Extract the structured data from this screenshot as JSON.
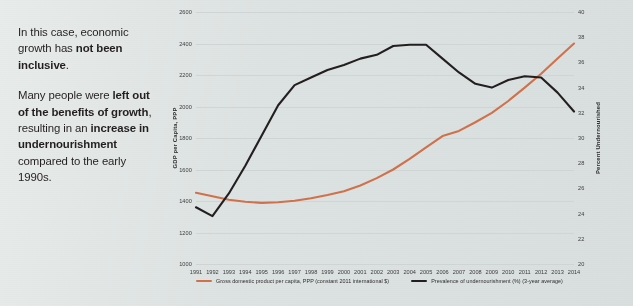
{
  "narrative": {
    "paragraph1": [
      {
        "text": "In this case, economic growth has ",
        "bold": false
      },
      {
        "text": "not been inclusive",
        "bold": true
      },
      {
        "text": ".",
        "bold": false
      }
    ],
    "paragraph2": [
      {
        "text": "Many people were ",
        "bold": false
      },
      {
        "text": "left out of the benefits of growth",
        "bold": true
      },
      {
        "text": ", resulting in an ",
        "bold": false
      },
      {
        "text": "increase in undernourishment",
        "bold": true
      },
      {
        "text": " compared to the early 1990s.",
        "bold": false
      }
    ]
  },
  "chart_data": {
    "type": "line",
    "title": "",
    "xlabel": "",
    "ylabel": "GDP per Capita, PPP",
    "y2label": "Percent Undernourished",
    "grid": true,
    "legend_position": "bottom",
    "categories": [
      1991,
      1992,
      1993,
      1994,
      1995,
      1996,
      1997,
      1998,
      1999,
      2000,
      2001,
      2002,
      2003,
      2004,
      2005,
      2006,
      2007,
      2008,
      2009,
      2010,
      2011,
      2012,
      2013,
      2014
    ],
    "xtick_labels": [
      "1991",
      "1992",
      "1993",
      "1994",
      "1995",
      "1996",
      "1997",
      "1998",
      "1999",
      "2000",
      "2001",
      "2002",
      "2003",
      "2004",
      "2005",
      "2006",
      "2007",
      "2008",
      "2009",
      "2010",
      "2011",
      "2012",
      "2013",
      "2014"
    ],
    "ylim": [
      1000,
      2600
    ],
    "ytick_labels": [
      "1000",
      "1200",
      "1400",
      "1600",
      "1800",
      "2000",
      "2200",
      "2400",
      "2600"
    ],
    "ytick_values": [
      1000,
      1200,
      1400,
      1600,
      1800,
      2000,
      2200,
      2400,
      2600
    ],
    "y2lim": [
      20,
      40
    ],
    "y2tick_labels": [
      "20",
      "22",
      "24",
      "26",
      "28",
      "30",
      "32",
      "34",
      "36",
      "38",
      "40"
    ],
    "y2tick_values": [
      20,
      22,
      24,
      26,
      28,
      30,
      32,
      34,
      36,
      38,
      40
    ],
    "series": [
      {
        "name": "Gross domestic product per capita, PPP (constant 2011 international $)",
        "axis": "left",
        "color": "#d2714a",
        "values": [
          1452,
          1430,
          1408,
          1395,
          1388,
          1392,
          1402,
          1418,
          1438,
          1462,
          1498,
          1545,
          1600,
          1668,
          1740,
          1812,
          1845,
          1900,
          1960,
          2035,
          2120,
          2208,
          2305,
          2400
        ]
      },
      {
        "name": "Prevalence of undernourishment (%) (3-year average)",
        "axis": "right",
        "color": "#231f20",
        "values": [
          24.5,
          23.8,
          25.6,
          27.8,
          30.2,
          32.6,
          34.2,
          34.8,
          35.4,
          35.8,
          36.3,
          36.6,
          37.3,
          37.4,
          37.4,
          36.3,
          35.2,
          34.3,
          34.0,
          34.6,
          34.9,
          34.8,
          33.6,
          32.1
        ]
      }
    ]
  },
  "legend": [
    {
      "label": "Gross domestic product per capita, PPP (constant 2011 international $)",
      "color": "#d2714a"
    },
    {
      "label": "Prevalence of undernourishment (%) (3-year average)",
      "color": "#231f20"
    }
  ]
}
